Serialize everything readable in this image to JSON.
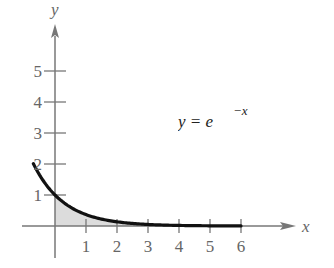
{
  "chart_data": {
    "type": "area",
    "title": "",
    "annotation": "y = e^{-x}",
    "equation_base": "y = e",
    "equation_exponent": "−x",
    "xlabel": "x",
    "ylabel": "y",
    "x_ticks": [
      "1",
      "2",
      "3",
      "4",
      "5",
      "6"
    ],
    "y_ticks": [
      "1",
      "2",
      "3",
      "4",
      "5"
    ],
    "xlim": [
      -1,
      8
    ],
    "ylim": [
      -1,
      7
    ],
    "grid": false,
    "legend": null,
    "series": [
      {
        "name": "y = e^{-x}",
        "x": [
          -0.7,
          0,
          1,
          2,
          3,
          4,
          5,
          6
        ],
        "y": [
          2.01,
          1.0,
          0.37,
          0.14,
          0.05,
          0.02,
          0.01,
          0.0
        ],
        "shaded_region": {
          "from_x": 0,
          "to_x": 6,
          "color": "#d9d9d9"
        }
      }
    ],
    "colors": {
      "curve": "#111111",
      "axes": "#777777",
      "shade": "#dcdcdc"
    }
  }
}
